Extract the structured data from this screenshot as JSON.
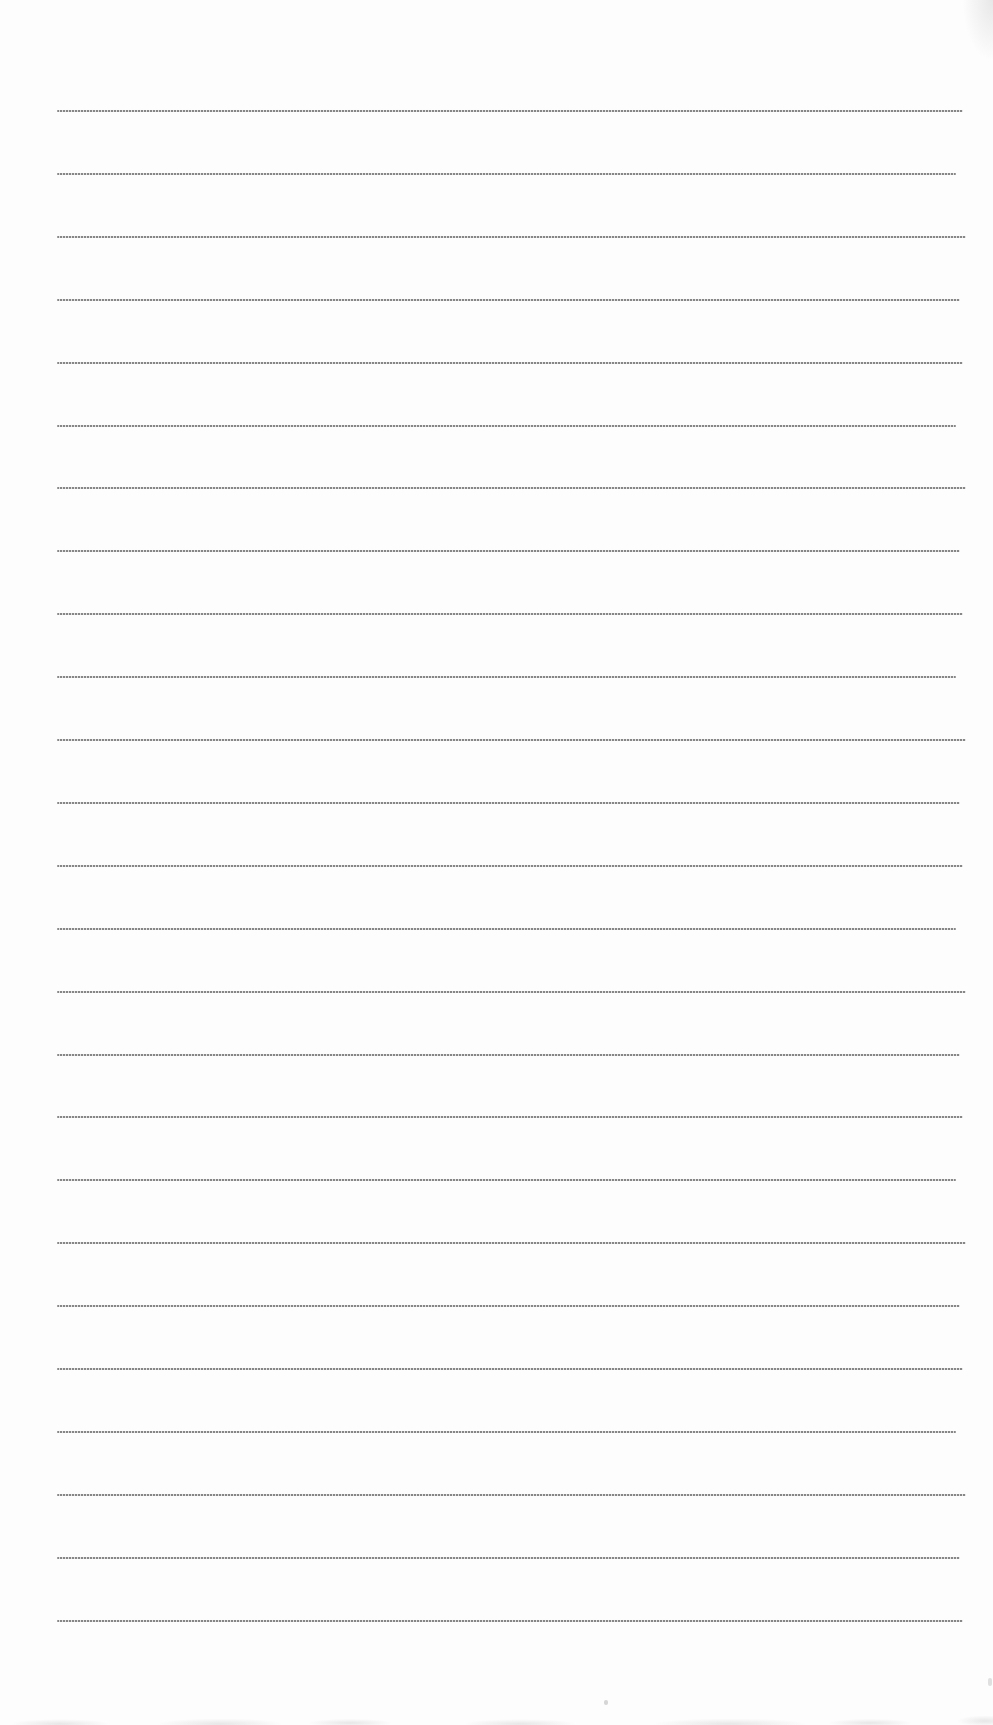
{
  "page": {
    "background_color": "#fdfdfd",
    "ruling": {
      "line_count": 25,
      "first_line_top": 110,
      "line_spacing": 62.9,
      "left_margin": 57,
      "line_widths": [
        906,
        899,
        909,
        903
      ],
      "line_color": "rgba(105,105,105,0.8)",
      "line_gap_color": "rgba(170,170,170,0.35)"
    },
    "scan_artifacts": {
      "edge_smudge_color": "rgba(180,180,180,0.3)"
    }
  }
}
